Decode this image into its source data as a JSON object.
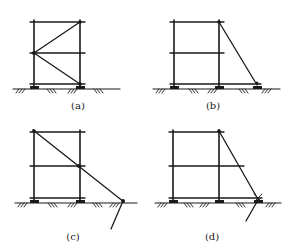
{
  "figure": {
    "panels": [
      {
        "id": "a",
        "label": "(a)",
        "description": "Two-bay scaffold frame with zig-zag diagonal bracing between posts"
      },
      {
        "id": "b",
        "label": "(b)",
        "description": "Scaffold frame with external raking shore from top of right post to ground"
      },
      {
        "id": "c",
        "label": "(c)",
        "description": "Scaffold frame with full-height raking shore from top of left post, anchored with ground stake"
      },
      {
        "id": "d",
        "label": "(d)",
        "description": "Scaffold frame with raking shore from top of right post, anchored with ground stake"
      }
    ],
    "colors": {
      "line": "#1a1a1a",
      "background": "#ffffff"
    }
  }
}
